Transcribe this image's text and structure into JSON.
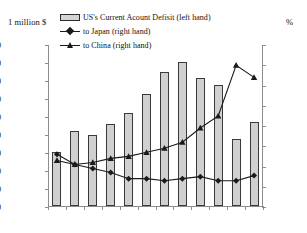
{
  "axes": {
    "left_unit": "1 million $",
    "right_unit": "%"
  },
  "legend": [
    {
      "label": "US's Current Acount Defisit  (left hand)",
      "marker": "bar-swatch-icon"
    },
    {
      "label": "to Japan  (right hand)",
      "marker": "diamond-marker-icon"
    },
    {
      "label": "to China  (right hand)",
      "marker": "triangle-marker-icon"
    }
  ],
  "chart_data": {
    "type": "bar",
    "title": "",
    "subtitle": "",
    "xlabel": "",
    "ylabel": "1 million $",
    "y2label": "%",
    "categories": [
      "1999",
      "2000",
      "2001",
      "2002",
      "2003",
      "2004",
      "2005",
      "2006",
      "2007",
      "2008",
      "2009",
      "2010"
    ],
    "ylim": [
      0,
      900000
    ],
    "y2lim": [
      0,
      80
    ],
    "yticks": [
      0,
      100000,
      200000,
      300000,
      400000,
      500000,
      600000,
      700000,
      800000,
      900000
    ],
    "yticklabels": [
      "0",
      "100000",
      "200000",
      "300000",
      "400000",
      "500000",
      "600000",
      "700000",
      "800000",
      "900000"
    ],
    "y2ticks": [
      0,
      10,
      20,
      30,
      40,
      50,
      60,
      70,
      80
    ],
    "y2ticklabels": [
      "0",
      "10",
      "20",
      "30",
      "40",
      "50",
      "60",
      "70",
      "80"
    ],
    "grid": false,
    "legend_position": "top-left",
    "series": [
      {
        "name": "US's Current Acount Defisit  (left hand)",
        "type": "bar",
        "axis": "left",
        "color": "#d0d0d0",
        "edge_color": "#3a3a3a",
        "values": [
          300000,
          415000,
          395000,
          455000,
          518000,
          625000,
          745000,
          798000,
          710000,
          675000,
          370000,
          465000
        ]
      },
      {
        "name": "to Japan  (right hand)",
        "type": "line",
        "axis": "right",
        "color": "#1a1a1a",
        "marker": "diamond",
        "values": [
          26,
          21,
          19,
          17,
          14,
          14,
          13,
          14,
          15,
          13,
          13,
          15.5
        ]
      },
      {
        "name": "to China  (right hand)",
        "type": "line",
        "axis": "right",
        "color": "#1a1a1a",
        "marker": "triangle",
        "values": [
          23,
          21,
          22,
          24,
          25,
          27,
          29,
          32,
          39,
          45,
          70,
          64
        ]
      }
    ]
  }
}
